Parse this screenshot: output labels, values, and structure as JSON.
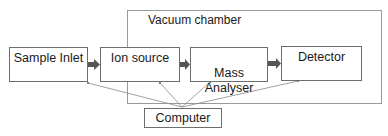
{
  "diagram": {
    "container": {
      "label": "Vacuum chamber"
    },
    "nodes": [
      {
        "id": "sample-inlet",
        "label": "Sample Inlet"
      },
      {
        "id": "ion-source",
        "label": "Ion source"
      },
      {
        "id": "mass-analyser",
        "label": "Mass\nAnalyser"
      },
      {
        "id": "detector",
        "label": "Detector"
      },
      {
        "id": "computer",
        "label": "Computer"
      }
    ],
    "edges": [
      {
        "from": "sample-inlet",
        "to": "ion-source",
        "style": "thick-arrow"
      },
      {
        "from": "ion-source",
        "to": "mass-analyser",
        "style": "thick-arrow"
      },
      {
        "from": "mass-analyser",
        "to": "detector",
        "style": "thick-arrow"
      },
      {
        "from": "computer",
        "to": "sample-inlet",
        "style": "thin-arrow"
      },
      {
        "from": "computer",
        "to": "ion-source",
        "style": "thin-arrow"
      },
      {
        "from": "computer",
        "to": "mass-analyser",
        "style": "thin-arrow"
      },
      {
        "from": "computer",
        "to": "detector",
        "style": "thin-arrow"
      }
    ],
    "colors": {
      "box_border": "#6e6e6e",
      "container_border": "#9a9a9a",
      "arrow": "#555555",
      "thin_line": "#8a8a8a"
    }
  }
}
